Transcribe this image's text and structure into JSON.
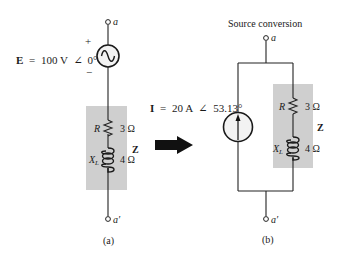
{
  "colors": {
    "wire": "#222222",
    "impedance_box": "#cfcfcf",
    "source_fill": "#f3f3f3",
    "arrow": "#111111",
    "text": "#1a1a1a"
  },
  "figure_a": {
    "caption": "(a)",
    "terminal_top": "a",
    "terminal_bottom": "a′",
    "source": {
      "type": "voltage-ac",
      "symbol": "E",
      "equals": "=",
      "value": "100 V",
      "angle_symbol": "∠",
      "angle": "0°",
      "plus": "+",
      "minus": "−"
    },
    "impedance": {
      "label": "Z",
      "resistor": {
        "symbol": "R",
        "value": "3 Ω"
      },
      "inductor": {
        "symbol": "X",
        "subscript": "L",
        "value": "4 Ω"
      }
    }
  },
  "conversion_arrow": {
    "icon": "right-arrow-icon"
  },
  "figure_b": {
    "title": "Source conversion",
    "caption": "(b)",
    "terminal_top": "a",
    "terminal_bottom": "a′",
    "source": {
      "type": "current",
      "symbol": "I",
      "equals": "=",
      "value": "20 A",
      "angle_symbol": "∠",
      "angle": "53.13°"
    },
    "impedance": {
      "label": "Z",
      "resistor": {
        "symbol": "R",
        "value": "3 Ω"
      },
      "inductor": {
        "symbol": "X",
        "subscript": "L",
        "value": "4 Ω"
      }
    }
  }
}
